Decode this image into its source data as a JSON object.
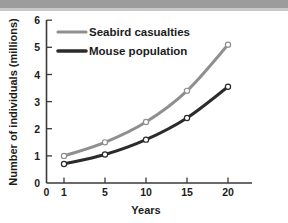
{
  "chart_data": {
    "type": "line",
    "title": "",
    "subtitle": "",
    "xlabel": "Years",
    "ylabel": "Number of individuals (millions)",
    "x": [
      1,
      5,
      10,
      15,
      20
    ],
    "xtick_labels": [
      "0",
      "1",
      "5",
      "10",
      "15",
      "20"
    ],
    "ytick_labels": [
      "0",
      "1",
      "2",
      "3",
      "4",
      "5",
      "6"
    ],
    "xlim": [
      0,
      6
    ],
    "ylim": [
      0,
      6
    ],
    "grid": false,
    "legend_position": "top-left-inside",
    "series": [
      {
        "name": "Seabird casualties",
        "color": "#8f8f8f",
        "marker": "open-circle",
        "values": [
          1.0,
          1.5,
          2.25,
          3.4,
          5.1
        ]
      },
      {
        "name": "Mouse population",
        "color": "#2b2b2b",
        "marker": "open-circle",
        "values": [
          0.7,
          1.05,
          1.6,
          2.4,
          3.55
        ]
      }
    ]
  },
  "axes": {
    "y_title": "Number of individuals (millions)",
    "x_title": "Years",
    "y_ticks": [
      {
        "label": "6",
        "value": 6
      },
      {
        "label": "5",
        "value": 5
      },
      {
        "label": "4",
        "value": 4
      },
      {
        "label": "3",
        "value": 3
      },
      {
        "label": "2",
        "value": 2
      },
      {
        "label": "1",
        "value": 1
      },
      {
        "label": "0",
        "value": 0
      }
    ],
    "x_ticks": [
      {
        "label": "0",
        "value": 0
      },
      {
        "label": "1",
        "value": 1
      },
      {
        "label": "5",
        "value": 5
      },
      {
        "label": "10",
        "value": 10
      },
      {
        "label": "15",
        "value": 15
      },
      {
        "label": "20",
        "value": 20
      }
    ]
  },
  "legend": {
    "items": [
      {
        "label": "Seabird casualties",
        "color": "#8f8f8f"
      },
      {
        "label": "Mouse population",
        "color": "#2b2b2b"
      }
    ]
  },
  "colors": {
    "seabird": "#8f8f8f",
    "mouse": "#2b2b2b",
    "axis": "#3a3a3a",
    "text": "#1c1c1c",
    "top_band": "#9c9c9c"
  }
}
